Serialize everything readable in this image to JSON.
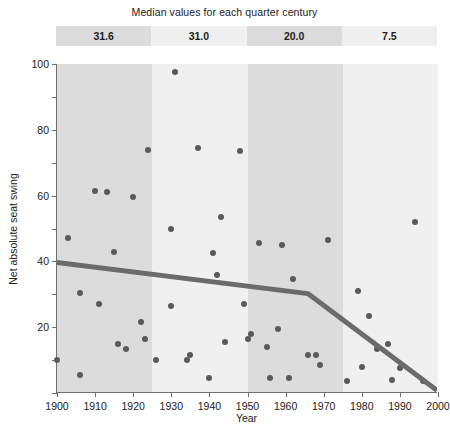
{
  "header": {
    "median_title": "Median values for each quarter century",
    "bands": [
      {
        "label": "31.6",
        "start": 1900,
        "end": 1925,
        "shade": "dark"
      },
      {
        "label": "31.0",
        "start": 1925,
        "end": 1950,
        "shade": "light"
      },
      {
        "label": "20.0",
        "start": 1950,
        "end": 1975,
        "shade": "dark"
      },
      {
        "label": "7.5",
        "start": 1975,
        "end": 2000,
        "shade": "light"
      }
    ]
  },
  "colors": {
    "band_dark": "#dcdcdc",
    "band_light": "#f0f0f0",
    "point": "#5a5a5a",
    "trend_line": "#6b6b6b",
    "axis": "#6f6f6f",
    "text": "#1c1c1c",
    "page_background": "#ffffff"
  },
  "chart_data": {
    "type": "scatter",
    "title": "Median values for each quarter century",
    "xlabel": "Year",
    "ylabel": "Net absolute seat swing",
    "xlim": [
      1900,
      2000
    ],
    "ylim": [
      0,
      100
    ],
    "xticks": [
      1900,
      1910,
      1920,
      1930,
      1940,
      1950,
      1960,
      1970,
      1980,
      1990,
      2000
    ],
    "xtick_labels": [
      "1900",
      "1910",
      "1920",
      "1930",
      "1940",
      "1950",
      "1960",
      "1970",
      "1980",
      "1990",
      "2000"
    ],
    "yticks": [
      0,
      10,
      20,
      30,
      40,
      50,
      60,
      70,
      80,
      90,
      100
    ],
    "ytick_labels": [
      "",
      "",
      "20",
      "",
      "40",
      "",
      "60",
      "",
      "80",
      "",
      "100"
    ],
    "ytick_labeled": [
      20,
      40,
      60,
      80,
      100
    ],
    "grid": false,
    "legend": "none",
    "quarter_century_medians": [
      {
        "period": "1900-1925",
        "median": 31.6
      },
      {
        "period": "1925-1950",
        "median": 31.0
      },
      {
        "period": "1950-1975",
        "median": 20.0
      },
      {
        "period": "1975-2000",
        "median": 7.5
      }
    ],
    "points": [
      {
        "x": 1900,
        "y": 10.0
      },
      {
        "x": 1903,
        "y": 47.0
      },
      {
        "x": 1906,
        "y": 30.5
      },
      {
        "x": 1906,
        "y": 5.5
      },
      {
        "x": 1910,
        "y": 61.5
      },
      {
        "x": 1911,
        "y": 27.0
      },
      {
        "x": 1913,
        "y": 61.0
      },
      {
        "x": 1915,
        "y": 43.0
      },
      {
        "x": 1916,
        "y": 15.0
      },
      {
        "x": 1918,
        "y": 13.5
      },
      {
        "x": 1920,
        "y": 59.5
      },
      {
        "x": 1922,
        "y": 21.5
      },
      {
        "x": 1923,
        "y": 16.5
      },
      {
        "x": 1924,
        "y": 74.0
      },
      {
        "x": 1926,
        "y": 10.0
      },
      {
        "x": 1930,
        "y": 50.0
      },
      {
        "x": 1930,
        "y": 26.5
      },
      {
        "x": 1931,
        "y": 97.5
      },
      {
        "x": 1934,
        "y": 10.0
      },
      {
        "x": 1935,
        "y": 11.5
      },
      {
        "x": 1937,
        "y": 74.5
      },
      {
        "x": 1940,
        "y": 4.5
      },
      {
        "x": 1941,
        "y": 42.5
      },
      {
        "x": 1942,
        "y": 36.0
      },
      {
        "x": 1943,
        "y": 53.5
      },
      {
        "x": 1944,
        "y": 15.5
      },
      {
        "x": 1948,
        "y": 73.5
      },
      {
        "x": 1949,
        "y": 27.0
      },
      {
        "x": 1950,
        "y": 16.5
      },
      {
        "x": 1951,
        "y": 18.0
      },
      {
        "x": 1953,
        "y": 45.5
      },
      {
        "x": 1955,
        "y": 14.0
      },
      {
        "x": 1956,
        "y": 4.5
      },
      {
        "x": 1958,
        "y": 19.5
      },
      {
        "x": 1959,
        "y": 45.0
      },
      {
        "x": 1961,
        "y": 4.5
      },
      {
        "x": 1962,
        "y": 34.5
      },
      {
        "x": 1966,
        "y": 11.5
      },
      {
        "x": 1968,
        "y": 11.5
      },
      {
        "x": 1969,
        "y": 8.5
      },
      {
        "x": 1971,
        "y": 46.5
      },
      {
        "x": 1976,
        "y": 3.5
      },
      {
        "x": 1979,
        "y": 31.0
      },
      {
        "x": 1980,
        "y": 8.0
      },
      {
        "x": 1982,
        "y": 23.5
      },
      {
        "x": 1984,
        "y": 13.5
      },
      {
        "x": 1987,
        "y": 15.0
      },
      {
        "x": 1988,
        "y": 4.0
      },
      {
        "x": 1990,
        "y": 7.5
      },
      {
        "x": 1994,
        "y": 52.0
      },
      {
        "x": 1996,
        "y": 3.5
      }
    ],
    "trend_line": {
      "style": "piecewise-linear",
      "vertices": [
        {
          "x": 1900,
          "y": 39.5
        },
        {
          "x": 1966,
          "y": 30.0
        },
        {
          "x": 2000,
          "y": 0.5
        }
      ]
    }
  }
}
